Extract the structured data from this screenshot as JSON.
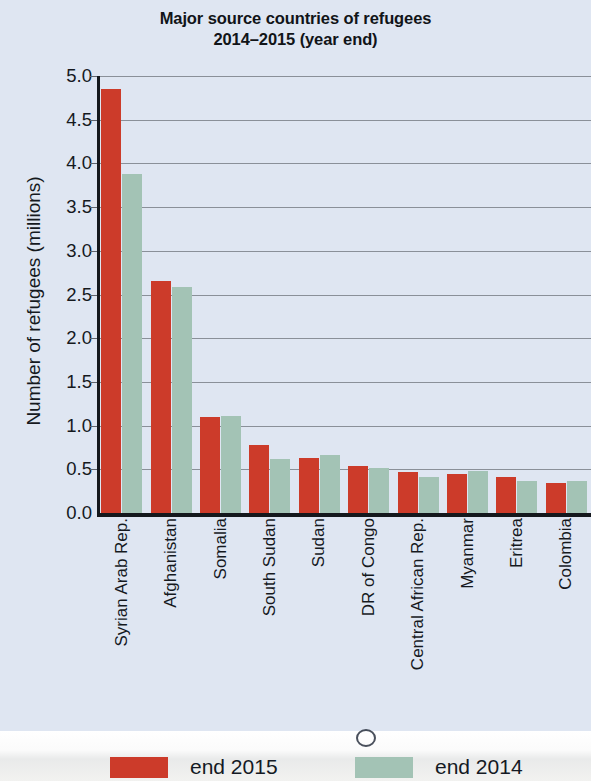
{
  "chart_data": {
    "type": "bar",
    "title": "Major source countries of refugees 2014–2015 (year end)",
    "title_line1": "Major source countries of refugees",
    "title_line2": "2014–2015 (year end)",
    "xlabel": "",
    "ylabel": "Number of refugees (millions)",
    "ylim": [
      0.0,
      5.0
    ],
    "ytick_labels": [
      "5.0",
      "4.5",
      "4.0",
      "3.5",
      "3.0",
      "2.5",
      "2.0",
      "1.5",
      "1.0",
      "0.5",
      "0.0"
    ],
    "ytick_values": [
      5.0,
      4.5,
      4.0,
      3.5,
      3.0,
      2.5,
      2.0,
      1.5,
      1.0,
      0.5,
      0.0
    ],
    "grid": true,
    "legend_position": "bottom",
    "categories": [
      "Syrian Arab Rep.",
      "Afghanistan",
      "Somalia",
      "South Sudan",
      "Sudan",
      "DR of Congo",
      "Central African Rep.",
      "Myanmar",
      "Eritrea",
      "Colombia"
    ],
    "series": [
      {
        "name": "end 2015",
        "color": "#cc3b2a",
        "values": [
          4.85,
          2.65,
          1.1,
          0.78,
          0.63,
          0.54,
          0.47,
          0.45,
          0.41,
          0.34
        ]
      },
      {
        "name": "end 2014",
        "color": "#a3c3b5",
        "values": [
          3.88,
          2.59,
          1.11,
          0.62,
          0.66,
          0.52,
          0.41,
          0.48,
          0.37,
          0.37
        ]
      }
    ]
  },
  "legend": {
    "items": [
      {
        "label": "end 2015",
        "color": "#cc3b2a"
      },
      {
        "label": "end 2014",
        "color": "#a3c3b5"
      }
    ]
  },
  "colors": {
    "background": "#dfe6f2",
    "axis": "#14181d",
    "gridline": "#8a9099",
    "series_2015": "#cc3b2a",
    "series_2014": "#a3c3b5",
    "text": "#15191e"
  }
}
